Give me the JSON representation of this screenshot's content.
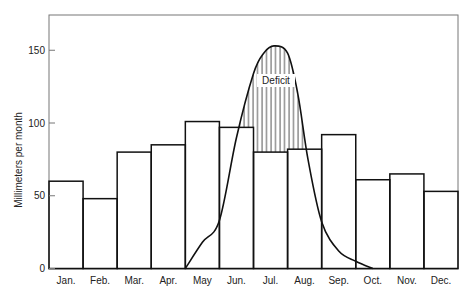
{
  "chart_data": {
    "type": "bar",
    "title": "",
    "xlabel": "",
    "ylabel": "Millimeters per month",
    "ylim": [
      0,
      175
    ],
    "yticks": [
      0,
      50,
      100,
      150
    ],
    "grid": false,
    "categories": [
      "Jan.",
      "Feb.",
      "Mar.",
      "Apr.",
      "May",
      "Jun.",
      "Jul.",
      "Aug.",
      "Sep.",
      "Oct.",
      "Nov.",
      "Dec."
    ],
    "series": [
      {
        "name": "Monthly precipitation",
        "type": "bar",
        "values": [
          60,
          48,
          80,
          85,
          101,
          97,
          80,
          82,
          92,
          61,
          65,
          53
        ]
      },
      {
        "name": "Water need curve",
        "type": "line",
        "x": [
          4.0,
          4.5,
          5.0,
          5.5,
          6.0,
          6.3,
          6.6,
          7.0,
          7.3,
          7.6,
          8.0,
          8.5,
          9.0,
          9.5
        ],
        "values": [
          0,
          18,
          33,
          90,
          134,
          148,
          153,
          148,
          120,
          75,
          32,
          12,
          5,
          0
        ]
      }
    ],
    "annotations": [
      {
        "text": "Deficit",
        "region": "hatched area between curve and bars, Jun.–Aug."
      }
    ]
  },
  "labels": {
    "ylabel": "Millimeters per month",
    "deficit": "Deficit",
    "yticks": [
      "0",
      "50",
      "100",
      "150"
    ],
    "months": [
      "Jan.",
      "Feb.",
      "Mar.",
      "Apr.",
      "May",
      "Jun.",
      "Jul.",
      "Aug.",
      "Sep.",
      "Oct.",
      "Nov.",
      "Dec."
    ]
  },
  "colors": {
    "frame": "#777777",
    "bars": "#111111",
    "curve": "#111111",
    "hatch": "#222222"
  }
}
